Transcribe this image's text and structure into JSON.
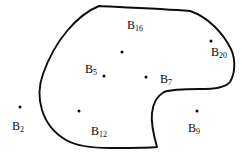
{
  "figure": {
    "width": 242,
    "height": 156,
    "background_color": "#ffffff",
    "ink_color": "#0d0d0d"
  },
  "region": {
    "name": "closed-region-boundary",
    "stroke_color": "#0d0d0d",
    "stroke_width": 1.9,
    "fill": "none",
    "path": "M 99 6 C 130 7.5 165 9 190 11 C 208 17 223 33 231 49 C 236 60 235 74 230 82 C 225 88 214 89 200 89 C 186 89 172 89 164 92 C 157 96 153 104 152 113 C 151 122 153 133 157 147 C 150 148 130 148 110 148 C 95 148 78 147 66 140 C 54 133 46 123 42 110 C 38 97 39 85 43 74 C 48 60 56 44 67 31 C 77 19 89 10 99 6 Z"
  },
  "points": [
    {
      "id": "B2",
      "label_prefix": "B",
      "label_subscript": "2",
      "dot_x": 20,
      "dot_y": 107,
      "label_x": 18,
      "label_y": 126,
      "inside_region": false
    },
    {
      "id": "B16",
      "label_prefix": "B",
      "label_subscript": "16",
      "dot_x": 122,
      "dot_y": 52,
      "label_x": 135,
      "label_y": 25,
      "inside_region": true
    },
    {
      "id": "B20",
      "label_prefix": "B",
      "label_subscript": "20",
      "dot_x": 211,
      "dot_y": 41,
      "label_x": 219,
      "label_y": 52,
      "inside_region": true
    },
    {
      "id": "B5",
      "label_prefix": "B",
      "label_subscript": "5",
      "dot_x": 104,
      "dot_y": 76,
      "label_x": 91,
      "label_y": 69,
      "inside_region": true
    },
    {
      "id": "B7",
      "label_prefix": "B",
      "label_subscript": "7",
      "dot_x": 146,
      "dot_y": 77,
      "label_x": 166,
      "label_y": 79,
      "inside_region": true
    },
    {
      "id": "B12",
      "label_prefix": "B",
      "label_subscript": "12",
      "dot_x": 79,
      "dot_y": 111,
      "label_x": 99,
      "label_y": 131,
      "inside_region": true
    },
    {
      "id": "B9",
      "label_prefix": "B",
      "label_subscript": "9",
      "dot_x": 197,
      "dot_y": 111,
      "label_x": 194,
      "label_y": 128,
      "inside_region": false
    }
  ]
}
